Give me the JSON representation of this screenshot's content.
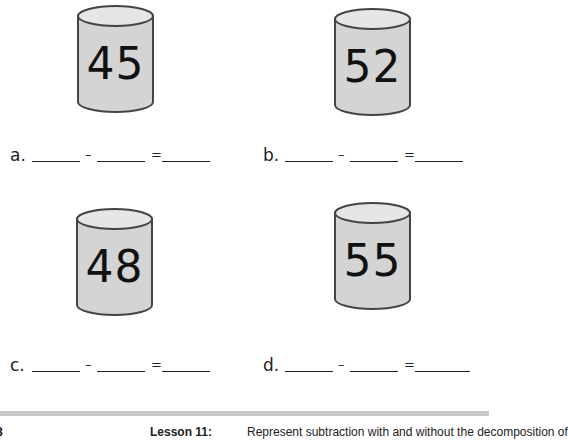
{
  "problems": [
    {
      "label": "a.",
      "number": "45",
      "minus": "–",
      "equals": "="
    },
    {
      "label": "b.",
      "number": "52",
      "minus": "–",
      "equals": "="
    },
    {
      "label": "c.",
      "number": "48",
      "minus": "–",
      "equals": "="
    },
    {
      "label": "d.",
      "number": "55",
      "minus": "–",
      "equals": "="
    }
  ],
  "colors": {
    "cylinder_fill": "#d4d4d4",
    "cylinder_top": "#e6e6e6",
    "outline": "#444444",
    "footer_bar": "#c8c8c8"
  },
  "footer": {
    "page_number": "8",
    "lesson": "Lesson 11:",
    "description": "Represent subtraction with and without the decomposition of"
  }
}
